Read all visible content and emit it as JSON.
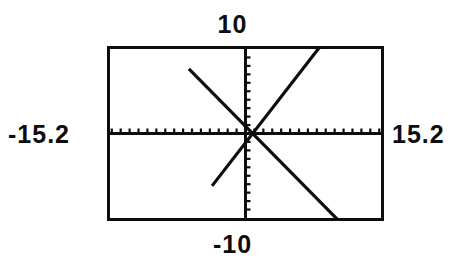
{
  "device": {
    "kind": "graphing-calculator-screen",
    "ink_color": "#0d0d0d",
    "screen_background": "#ffffff"
  },
  "window_labels": {
    "ymax": "10",
    "ymin": "-10",
    "xmin": "-15.2",
    "xmax": "15.2"
  },
  "chart_data": {
    "type": "line",
    "title": "",
    "xlabel": "",
    "ylabel": "",
    "xlim": [
      -15.2,
      15.2
    ],
    "ylim": [
      -10,
      10
    ],
    "grid": false,
    "legend": "none",
    "axes": {
      "x_axis_drawn": true,
      "y_axis_drawn": true,
      "tick_marks": true,
      "xscl": 1,
      "yscl": 1,
      "x_ticks_each_side": 15,
      "y_ticks_each_side": 10
    },
    "annotations": [
      {
        "text": "intersection",
        "x": 0.8,
        "y": 0.0
      }
    ],
    "series": [
      {
        "name": "decreasing-line",
        "slope": -1.07,
        "intercept": 0.86,
        "x": [
          -6.35,
          14.7
        ],
        "values": [
          7.66,
          -14.86
        ]
      },
      {
        "name": "increasing-line",
        "slope": 1.36,
        "intercept": -1.09,
        "x": [
          -3.75,
          10.1
        ],
        "values": [
          -6.2,
          12.65
        ]
      }
    ],
    "pixel_geometry": {
      "viewport": {
        "x": 107,
        "y": 46,
        "width": 277,
        "height": 175
      },
      "origin": {
        "x": 139,
        "y": 87
      },
      "decreasing_line": {
        "x1": 58,
        "y1": 4,
        "x2": 269,
        "y2": 154
      },
      "increasing_line": {
        "x1": 105,
        "y1": 173,
        "x2": 231,
        "y2": 4
      },
      "intersection": {
        "x": 165,
        "y": 87
      }
    }
  }
}
